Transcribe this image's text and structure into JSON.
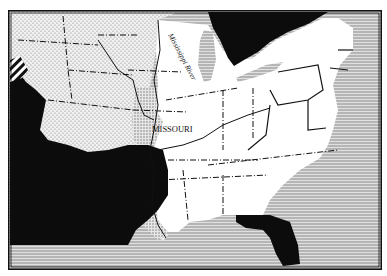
{
  "map": {
    "title": "",
    "labels": {
      "missouri": "MISSOURI",
      "mississippi_river": "Mississippi River"
    },
    "colors": {
      "paper": "#ffffff",
      "ink": "#111111",
      "water_line": "#8a8a8a",
      "water_bg": "#d8d8d8",
      "stipple_bg": "#f1f1f1",
      "stipple_dot": "#7a7a7a",
      "foreign": "#0c0c0c"
    },
    "legend_regions": [
      {
        "name": "territories-stippled",
        "pattern": "dots"
      },
      {
        "name": "states-white",
        "pattern": "none"
      },
      {
        "name": "foreign-black",
        "pattern": "solid"
      },
      {
        "name": "water-hatched",
        "pattern": "horizontal-lines"
      }
    ]
  }
}
